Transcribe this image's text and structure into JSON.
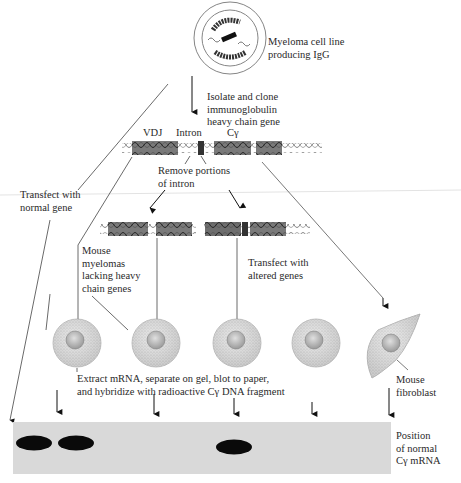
{
  "labels": {
    "myeloma": [
      "Myeloma cell line",
      "producing IgG"
    ],
    "isolate": [
      "Isolate and clone",
      "immunoglobulin",
      "heavy chain gene"
    ],
    "vdj": "VDJ",
    "intron": "Intron",
    "cgamma": "Cγ",
    "remove": [
      "Remove portions",
      "of intron"
    ],
    "transfect_normal": [
      "Transfect with",
      "normal gene"
    ],
    "mouse_myelomas": [
      "Mouse",
      "myelomas",
      "lacking heavy",
      "chain genes"
    ],
    "transfect_altered": [
      "Transfect with",
      "altered genes"
    ],
    "extract": [
      "Extract mRNA, separate on gel, blot to paper,",
      "and hybridize with radioactive Cγ DNA fragment"
    ],
    "fibroblast": [
      "Mouse",
      "fibroblast"
    ],
    "position": [
      "Position",
      "of normal",
      "Cγ mRNA"
    ]
  },
  "blot": {
    "lanes": 6,
    "bands_present": [
      true,
      true,
      false,
      true,
      false,
      false
    ],
    "gel_color": "#d9d9d9",
    "band_color": "#0a0a0a"
  },
  "colors": {
    "exon": "#7a7a7a",
    "intron_block": "#333333",
    "line": "#444444",
    "cell_fill": "#cfcfcf"
  }
}
